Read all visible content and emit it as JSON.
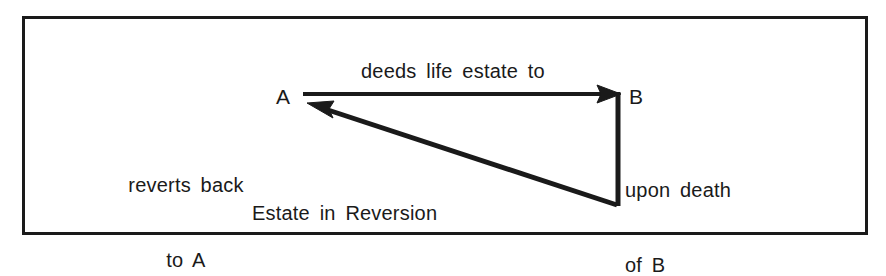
{
  "figure": {
    "type": "legal-estate-diagram",
    "caption": "Estate in Reversion",
    "border_color": "#1a1a1a",
    "ink_color": "#1a1a1a",
    "background_color": "#ffffff"
  },
  "nodes": {
    "a": "A",
    "b": "B"
  },
  "labels": {
    "deeds": "deeds life estate to",
    "reverts_line1": "reverts back",
    "reverts_line2": "to A",
    "upon_death_line1": "upon death",
    "upon_death_line2": "of B",
    "caption": "Estate in Reversion"
  },
  "arrows": [
    {
      "name": "deeds-arrow",
      "from": "A",
      "to": "B",
      "label": "deeds life estate to",
      "direction": "right"
    },
    {
      "name": "reversion-arrow",
      "from": "B",
      "to": "A",
      "label": "reverts back to A",
      "direction": "up-left"
    },
    {
      "name": "death-connector",
      "from": "B",
      "to": "reversion-start",
      "label": "upon death of B",
      "direction": "down"
    }
  ]
}
